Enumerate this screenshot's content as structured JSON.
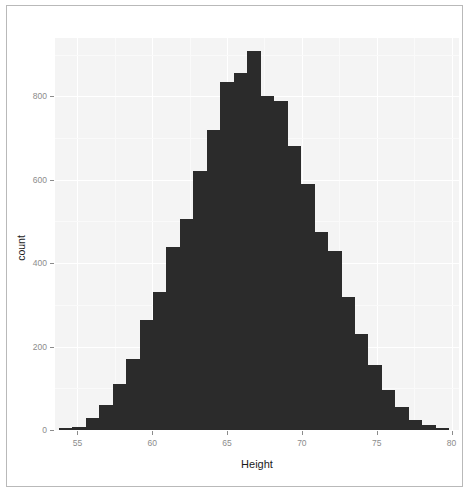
{
  "chart_data": {
    "type": "bar",
    "title": "",
    "subtitle": "",
    "xlabel": "Height",
    "ylabel": "count",
    "xlim": [
      53.5,
      80.5
    ],
    "ylim": [
      0,
      940
    ],
    "grid": true,
    "legend": null,
    "bin_width": 0.9,
    "panel_background": "#f4f4f4",
    "bar_color": "#2b2b2b",
    "axis_text_color": "#8c8c8c",
    "axis_title_color": "#1a1a1a",
    "xticks": [
      55,
      60,
      65,
      70,
      75,
      80
    ],
    "yticks": [
      0,
      200,
      400,
      600,
      800
    ],
    "xtick_labels": [
      "55",
      "60",
      "65",
      "70",
      "75",
      "80"
    ],
    "ytick_labels": [
      "0",
      "200",
      "400",
      "600",
      "800"
    ],
    "categories": [
      54.2,
      55.1,
      56.0,
      56.9,
      57.8,
      58.7,
      59.6,
      60.5,
      61.4,
      62.3,
      63.2,
      64.1,
      65.0,
      65.9,
      66.8,
      67.7,
      68.6,
      69.5,
      70.4,
      71.3,
      72.2,
      73.1,
      74.0,
      74.9,
      75.8,
      76.7,
      77.6,
      78.5,
      79.4
    ],
    "values": [
      5,
      8,
      30,
      60,
      110,
      170,
      265,
      330,
      440,
      505,
      620,
      720,
      835,
      855,
      910,
      800,
      790,
      680,
      590,
      475,
      430,
      320,
      230,
      155,
      95,
      55,
      25,
      12,
      6
    ]
  },
  "axis": {
    "ylabel": "count",
    "xlabel": "Height"
  }
}
